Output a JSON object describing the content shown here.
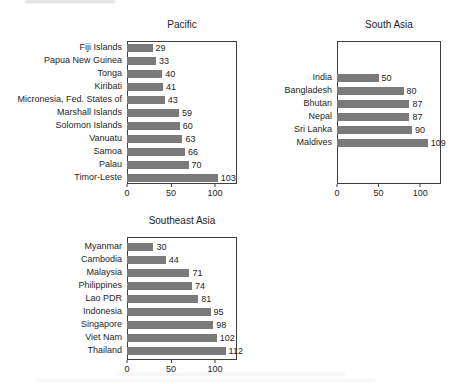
{
  "page": {
    "background": "#ffffff"
  },
  "style": {
    "bar_color": "#7a7a7a",
    "box_border_color": "#3f3f3f",
    "text_color": "#1e1e1e",
    "background": "#ffffff"
  },
  "chart_data": [
    {
      "type": "bar",
      "orientation": "horizontal",
      "title": "Pacific",
      "categories": [
        "Fiji Islands",
        "Papua New Guinea",
        "Tonga",
        "Kiribati",
        "Micronesia, Fed. States of",
        "Marshall Islands",
        "Solomon Islands",
        "Vanuatu",
        "Samoa",
        "Palau",
        "Timor-Leste"
      ],
      "values": [
        29,
        33,
        40,
        41,
        43,
        59,
        60,
        63,
        66,
        70,
        103
      ],
      "value_labels": true,
      "xlim": [
        0,
        125
      ],
      "xticks": [
        0,
        50,
        100
      ],
      "grid": false,
      "legend": false
    },
    {
      "type": "bar",
      "orientation": "horizontal",
      "title": "South Asia",
      "categories": [
        "India",
        "Bangladesh",
        "Bhutan",
        "Nepal",
        "Sri Lanka",
        "Maldives"
      ],
      "values": [
        50,
        80,
        87,
        87,
        90,
        109
      ],
      "value_labels": true,
      "xlim": [
        0,
        125
      ],
      "xticks": [
        0,
        50,
        100
      ],
      "grid": false,
      "legend": false
    },
    {
      "type": "bar",
      "orientation": "horizontal",
      "title": "Southeast Asia",
      "categories": [
        "Myanmar",
        "Cambodia",
        "Malaysia",
        "Philippines",
        "Lao PDR",
        "Indonesia",
        "Singapore",
        "Viet Nam",
        "Thailand"
      ],
      "values": [
        30,
        44,
        71,
        74,
        81,
        95,
        98,
        102,
        112
      ],
      "value_labels": true,
      "xlim": [
        0,
        125
      ],
      "xticks": [
        0,
        50,
        100
      ],
      "grid": false,
      "legend": false
    }
  ]
}
